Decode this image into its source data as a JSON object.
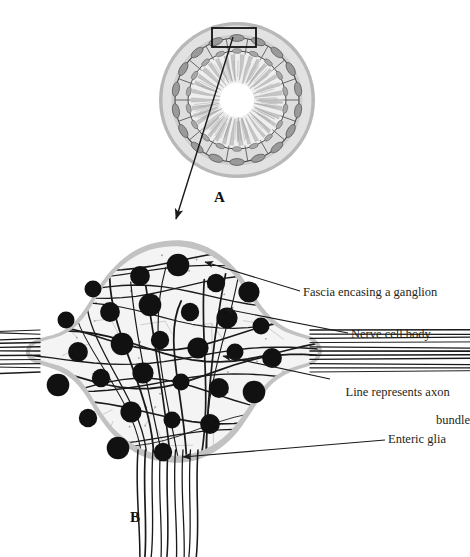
{
  "figure": {
    "panels": [
      {
        "id": "A",
        "letter": "A",
        "caption": "Intestinal cross-section with myenteric ganglion highlighted"
      },
      {
        "id": "B",
        "letter": "B",
        "caption": "Magnified enteric ganglion"
      }
    ]
  },
  "labels": {
    "fascia": "Fascia encasing a ganglion",
    "nerve_cell_body": "Nerve cell body",
    "axon_bundle_line1": "Line represents axon",
    "axon_bundle_line2": "bundle",
    "enteric_glia": "Enteric glia"
  },
  "colors": {
    "background": "#ffffff",
    "ink": "#231f20",
    "outer_serosa": "#b3b3b3",
    "muscle_ring": "#d9d9d9",
    "ganglion_ellipse": "#9a9a9a",
    "inner_ring": "#e6e6e6",
    "villi": "#bdbdbd",
    "lumen": "#ffffff",
    "neuron_body": "#111111",
    "fascia_band": "#c4c4c4",
    "ganglion_fill": "#f2f2f2",
    "glia_mesh": "#b0b0b0",
    "axon_line": "#1a1a1a"
  },
  "panel_a": {
    "center_x": 237,
    "center_y": 100,
    "radius_outer": 78,
    "highlight_box": {
      "x": 212,
      "y": 28,
      "width": 44,
      "height": 19
    },
    "ganglion_count": 18
  },
  "panel_b": {
    "neuron_count": 29,
    "axon_bundles_left": 11,
    "axon_bundles_right": 11,
    "axon_bundles_bottom": 9
  }
}
